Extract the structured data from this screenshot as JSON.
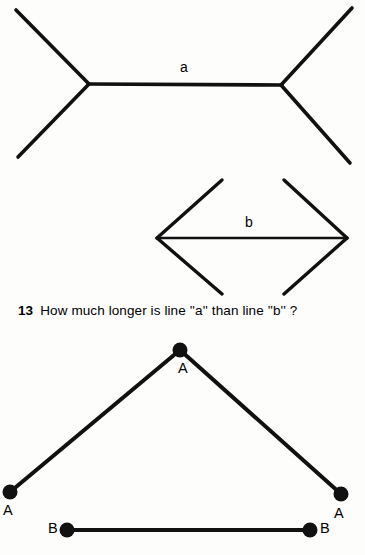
{
  "page": {
    "background_color": "#fdfdfc",
    "ink_color": "#111111",
    "width": 365,
    "height": 555
  },
  "figure_muller_lyer": {
    "name": "muller-lyer-illusion",
    "line_a": {
      "label": "a",
      "arrowhead_style": "outward-fins",
      "shaft": {
        "x1": 88,
        "y1": 84,
        "x2": 282,
        "y2": 85
      },
      "fins": [
        {
          "x1": 88,
          "y1": 84,
          "x2": 16,
          "y2": 10
        },
        {
          "x1": 88,
          "y1": 84,
          "x2": 18,
          "y2": 157
        },
        {
          "x1": 282,
          "y1": 85,
          "x2": 352,
          "y2": 8
        },
        {
          "x1": 282,
          "y1": 85,
          "x2": 350,
          "y2": 163
        }
      ]
    },
    "line_b": {
      "label": "b",
      "arrowhead_style": "inward-fins",
      "shaft": {
        "x1": 157,
        "y1": 238,
        "x2": 347,
        "y2": 238
      },
      "fins": [
        {
          "x1": 157,
          "y1": 238,
          "x2": 222,
          "y2": 180
        },
        {
          "x1": 157,
          "y1": 238,
          "x2": 222,
          "y2": 294
        },
        {
          "x1": 347,
          "y1": 238,
          "x2": 284,
          "y2": 180
        },
        {
          "x1": 347,
          "y1": 238,
          "x2": 284,
          "y2": 294
        }
      ]
    }
  },
  "question": {
    "number": "13",
    "text": "How much longer is line ''a'' than line ''b'' ?"
  },
  "figure_chevron": {
    "name": "chevron-vs-segment",
    "chevron": {
      "apex": {
        "x": 180,
        "y": 350,
        "label": "A"
      },
      "left_end": {
        "x": 10,
        "y": 492,
        "label": "A"
      },
      "right_end": {
        "x": 341,
        "y": 494,
        "label": "A"
      }
    },
    "segment": {
      "left_end": {
        "x": 67,
        "y": 530,
        "label": "B"
      },
      "right_end": {
        "x": 310,
        "y": 530,
        "label": "B"
      }
    },
    "dot_radius": 7
  }
}
